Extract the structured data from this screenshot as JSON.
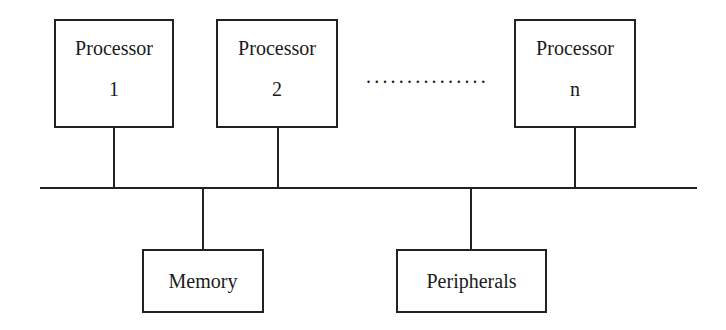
{
  "diagram": {
    "type": "shared-bus multiprocessor architecture",
    "processors": [
      {
        "label": "Processor",
        "index": "1"
      },
      {
        "label": "Processor",
        "index": "2"
      },
      {
        "label": "Processor",
        "index": "n"
      }
    ],
    "ellipsis": "...............",
    "shared": [
      {
        "label": "Memory"
      },
      {
        "label": "Peripherals"
      }
    ],
    "colors": {
      "line": "#222222",
      "background": "#ffffff",
      "text": "#1a1a1a"
    }
  }
}
